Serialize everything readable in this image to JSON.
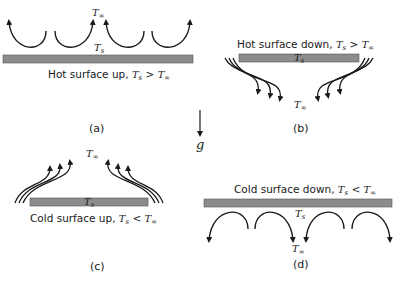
{
  "figure": {
    "gravity_label": "g",
    "panels": [
      {
        "id": "a",
        "caption": "(a)",
        "description": "Hot surface up, ",
        "condition_lhs": "T",
        "condition_lhs_sub": "s",
        "operator": " > ",
        "condition_rhs": "T",
        "condition_rhs_sub": "∞",
        "surface_label": "T",
        "surface_sub": "s",
        "ambient_label": "T",
        "ambient_sub": "∞",
        "flow": "rising cells above plate"
      },
      {
        "id": "b",
        "caption": "(b)",
        "description": "Hot surface down, ",
        "condition_lhs": "T",
        "condition_lhs_sub": "s",
        "operator": " > ",
        "condition_rhs": "T",
        "condition_rhs_sub": "∞",
        "surface_label": "T",
        "surface_sub": "s",
        "ambient_label": "T",
        "ambient_sub": "∞",
        "flow": "flow around edges below plate"
      },
      {
        "id": "c",
        "caption": "(c)",
        "description": "Cold surface up, ",
        "condition_lhs": "T",
        "condition_lhs_sub": "s",
        "operator": " < ",
        "condition_rhs": "T",
        "condition_rhs_sub": "∞",
        "surface_label": "T",
        "surface_sub": "s",
        "ambient_label": "T",
        "ambient_sub": "∞",
        "flow": "flow around edges above plate"
      },
      {
        "id": "d",
        "caption": "(d)",
        "description": "Cold surface down, ",
        "condition_lhs": "T",
        "condition_lhs_sub": "s",
        "operator": " < ",
        "condition_rhs": "T",
        "condition_rhs_sub": "∞",
        "surface_label": "T",
        "surface_sub": "s",
        "ambient_label": "T",
        "ambient_sub": "∞",
        "flow": "sinking cells below plate"
      }
    ],
    "colors": {
      "plate": "#8c8c8c",
      "plate_border": "#555555",
      "stroke": "#1a1a1a"
    }
  }
}
